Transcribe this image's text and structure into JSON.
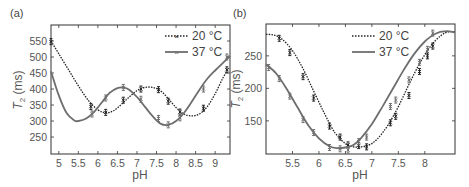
{
  "chart_data": [
    {
      "panel": "(a)",
      "type": "line",
      "title": "",
      "xlabel": "pH",
      "ylabel": "T2 (ms)",
      "xlim": [
        4.8,
        9.38
      ],
      "ylim": [
        197,
        600
      ],
      "xticks": [
        5,
        5.5,
        6,
        6.5,
        7,
        7.5,
        8,
        8.5,
        9
      ],
      "xtick_labels": [
        "5",
        "5.5",
        "6",
        "6.5",
        "7",
        "7.5",
        "8",
        "8.5",
        "9"
      ],
      "yticks": [
        250,
        300,
        350,
        400,
        450,
        500,
        550
      ],
      "ytick_labels": [
        "250",
        "300",
        "350",
        "400",
        "450",
        "500",
        "550"
      ],
      "grid": false,
      "legend_position": "upper right",
      "series": [
        {
          "name": "20 °C",
          "style": "dotted",
          "marker": "x with error bars",
          "curve": {
            "x": [
              4.8,
              5.0,
              5.25,
              5.5,
              5.75,
              6.0,
              6.2,
              6.4,
              6.6,
              6.8,
              7.0,
              7.2,
              7.4,
              7.6,
              7.8,
              8.0,
              8.2,
              8.4,
              8.6,
              8.8,
              9.0,
              9.2,
              9.35
            ],
            "y": [
              550,
              510,
              460,
              410,
              365,
              335,
              326,
              332,
              352,
              375,
              395,
              405,
              405,
              395,
              370,
              342,
              322,
              316,
              322,
              345,
              385,
              435,
              465
            ]
          },
          "points": {
            "x": [
              4.8,
              5.82,
              6.2,
              6.65,
              7.1,
              7.55,
              7.8,
              8.1,
              8.7,
              9.3
            ],
            "y": [
              548,
              345,
              327,
              365,
              400,
              398,
              362,
              328,
              340,
              460
            ]
          }
        },
        {
          "name": "37 °C",
          "style": "solid",
          "marker": "x with error bars",
          "curve": {
            "x": [
              4.8,
              5.0,
              5.2,
              5.4,
              5.5,
              5.7,
              5.9,
              6.1,
              6.3,
              6.5,
              6.65,
              6.8,
              7.0,
              7.2,
              7.4,
              7.6,
              7.8,
              8.0,
              8.2,
              8.4,
              8.6,
              8.8,
              9.0,
              9.2,
              9.38
            ],
            "y": [
              455,
              380,
              325,
              302,
              300,
              308,
              328,
              358,
              388,
              403,
              405,
              398,
              375,
              345,
              315,
              292,
              288,
              300,
              325,
              360,
              398,
              432,
              458,
              482,
              503
            ]
          },
          "points": {
            "x": [
              5.85,
              6.2,
              6.65,
              7.1,
              7.55,
              7.8,
              8.1,
              8.7,
              9.3
            ],
            "y": [
              322,
              372,
              405,
              368,
              308,
              288,
              310,
              400,
              500
            ]
          }
        }
      ]
    },
    {
      "panel": "(b)",
      "type": "line",
      "title": "",
      "xlabel": "pH",
      "ylabel": "T2 (ms)",
      "xlim": [
        5.0,
        8.57
      ],
      "ylim": [
        99,
        299
      ],
      "xticks": [
        5.5,
        6,
        6.5,
        7,
        7.5,
        8
      ],
      "xtick_labels": [
        "5.5",
        "6",
        "6.5",
        "7",
        "7.5",
        "8"
      ],
      "yticks": [
        150,
        200,
        250
      ],
      "ytick_labels": [
        "150",
        "200",
        "250"
      ],
      "grid": false,
      "legend_position": "upper right",
      "series": [
        {
          "name": "20 °C",
          "style": "dotted",
          "marker": "x with error bars",
          "curve": {
            "x": [
              5.0,
              5.15,
              5.3,
              5.5,
              5.7,
              5.9,
              6.1,
              6.3,
              6.5,
              6.65,
              6.8,
              6.95,
              7.1,
              7.3,
              7.5,
              7.7,
              7.9,
              8.1,
              8.3,
              8.45,
              8.57
            ],
            "y": [
              283,
              282,
              276,
              258,
              230,
              196,
              162,
              132,
              115,
              110,
              110,
              113,
              122,
              143,
              172,
              206,
              238,
              264,
              281,
              287,
              287
            ]
          },
          "points": {
            "x": [
              5.25,
              5.45,
              5.7,
              5.9,
              6.2,
              6.4,
              6.55,
              6.75,
              6.9,
              7.35,
              7.45,
              7.7,
              7.9,
              8.05,
              8.15
            ],
            "y": [
              277,
              255,
              218,
              185,
              142,
              125,
              113,
              112,
              110,
              147,
              157,
              189,
              226,
              250,
              265
            ]
          }
        },
        {
          "name": "37 °C",
          "style": "solid",
          "marker": "x with error bars",
          "curve": {
            "x": [
              5.0,
              5.2,
              5.4,
              5.6,
              5.8,
              6.0,
              6.2,
              6.35,
              6.5,
              6.65,
              6.8,
              7.0,
              7.2,
              7.4,
              7.6,
              7.8,
              8.0,
              8.2,
              8.4,
              8.57
            ],
            "y": [
              237,
              222,
              198,
              170,
              143,
              123,
              111,
              108,
              109,
              113,
              124,
              145,
              172,
              200,
              228,
              253,
              272,
              284,
              288,
              286
            ]
          },
          "points": {
            "x": [
              5.05,
              5.25,
              5.45,
              5.7,
              5.9,
              6.2,
              6.4,
              6.55,
              6.75,
              6.9,
              7.35,
              7.45,
              7.7,
              7.9,
              8.05,
              8.15
            ],
            "y": [
              232,
              215,
              188,
              152,
              132,
              109,
              107,
              105,
              118,
              125,
              172,
              182,
              213,
              240,
              260,
              285
            ]
          }
        }
      ]
    }
  ],
  "panels": {
    "a": {
      "label": "(a)",
      "xlabel": "pH",
      "ylabel_main": "T",
      "ylabel_sub": "2",
      "ylabel_unit": " (ms)",
      "legend": [
        "20 °C",
        "37 °C"
      ]
    },
    "b": {
      "label": "(b)",
      "xlabel": "pH",
      "ylabel_main": "T",
      "ylabel_sub": "2",
      "ylabel_unit": " (ms)",
      "legend": [
        "20 °C",
        "37 °C"
      ]
    }
  },
  "colors": {
    "series_20C": "#222222",
    "series_37C": "#6e6e6e",
    "axis": "#333333",
    "text": "#555555"
  }
}
